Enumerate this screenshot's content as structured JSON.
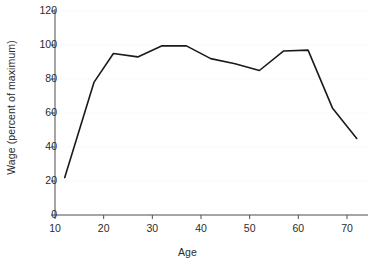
{
  "chart_data": {
    "type": "line",
    "title": "",
    "xlabel": "Age",
    "ylabel": "Wage (percent of maximum)",
    "xlim": [
      8,
      75
    ],
    "ylim": [
      0,
      128
    ],
    "xticks": [
      10,
      20,
      30,
      40,
      50,
      60,
      70
    ],
    "yticks": [
      0,
      20,
      40,
      60,
      80,
      100,
      120
    ],
    "grid": "faint-horizontal",
    "legend": "none",
    "line_color": "#1a1a1a",
    "series": [
      {
        "name": "Wage profile",
        "x": [
          12,
          18,
          22,
          27,
          32,
          37,
          42,
          47,
          52,
          57,
          62,
          67,
          72
        ],
        "values": [
          22,
          78,
          95,
          93,
          99.5,
          99.5,
          92,
          89,
          85,
          96.5,
          97,
          63,
          45
        ]
      }
    ]
  },
  "axes": {
    "x_tick_labels": [
      "10",
      "20",
      "30",
      "40",
      "50",
      "60",
      "70"
    ],
    "y_tick_labels": [
      "0",
      "20",
      "40",
      "60",
      "80",
      "100",
      "120"
    ],
    "x_axis_title": "Age",
    "y_axis_title": "Wage (percent of maximum)"
  }
}
